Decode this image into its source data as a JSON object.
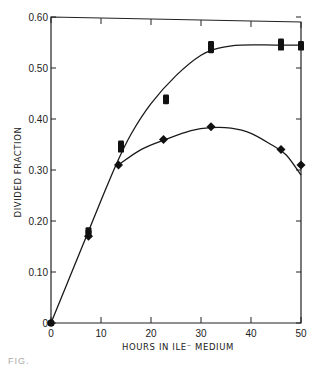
{
  "chart_data": {
    "type": "scatter",
    "title": "",
    "xlabel": "HOURS IN ILE⁻ MEDIUM",
    "ylabel": "DIVIDED FRACTION",
    "xlim": [
      0,
      50
    ],
    "ylim": [
      0,
      0.6
    ],
    "x_ticks": [
      "0",
      "10",
      "20",
      "30",
      "40",
      "50"
    ],
    "y_ticks": [
      "0",
      "0.10",
      "0.20",
      "0.30",
      "0.40",
      "0.50",
      "0.60"
    ],
    "grid": false,
    "legend": null,
    "series": [
      {
        "name": "squares",
        "marker": "square",
        "points": [
          [
            0,
            0.0
          ],
          [
            7.5,
            0.18
          ],
          [
            7.5,
            0.175
          ],
          [
            14,
            0.35
          ],
          [
            14,
            0.34
          ],
          [
            23,
            0.44
          ],
          [
            23,
            0.435
          ],
          [
            32,
            0.545
          ],
          [
            32,
            0.535
          ],
          [
            46,
            0.55
          ],
          [
            46,
            0.54
          ],
          [
            50,
            0.545
          ],
          [
            50,
            0.54
          ]
        ],
        "curve": [
          [
            0,
            0.0
          ],
          [
            5,
            0.12
          ],
          [
            10,
            0.24
          ],
          [
            13,
            0.31
          ],
          [
            16,
            0.37
          ],
          [
            20,
            0.43
          ],
          [
            25,
            0.485
          ],
          [
            30,
            0.525
          ],
          [
            34,
            0.54
          ],
          [
            38,
            0.545
          ],
          [
            45,
            0.545
          ],
          [
            50,
            0.545
          ]
        ]
      },
      {
        "name": "diamonds",
        "marker": "diamond",
        "points": [
          [
            0,
            0.0
          ],
          [
            7.5,
            0.17
          ],
          [
            13.5,
            0.31
          ],
          [
            22.5,
            0.36
          ],
          [
            32,
            0.385
          ],
          [
            46,
            0.34
          ],
          [
            50,
            0.31
          ]
        ],
        "curve": [
          [
            13.5,
            0.31
          ],
          [
            18,
            0.34
          ],
          [
            23,
            0.36
          ],
          [
            28,
            0.377
          ],
          [
            32,
            0.383
          ],
          [
            36,
            0.382
          ],
          [
            40,
            0.372
          ],
          [
            44,
            0.35
          ],
          [
            47,
            0.33
          ],
          [
            50,
            0.29
          ]
        ]
      }
    ]
  },
  "caption_fragment": "FIG."
}
